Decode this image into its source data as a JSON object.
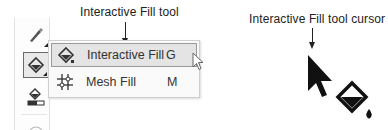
{
  "callouts": {
    "tool_label": "Interactive Fill tool",
    "cursor_label": "Interactive Fill tool cursor"
  },
  "toolbox": {
    "tools": [
      {
        "name": "pen-tool",
        "icon": "pen-icon",
        "active": false
      },
      {
        "name": "interactive-fill-tool",
        "icon": "fill-bucket-icon",
        "active": true
      },
      {
        "name": "smart-fill-tool",
        "icon": "smart-fill-icon",
        "active": false
      },
      {
        "name": "partially-visible-tool",
        "icon": "tool-icon",
        "active": false
      }
    ]
  },
  "flyout": {
    "items": [
      {
        "label": "Interactive Fill",
        "shortcut": "G",
        "icon": "fill-bucket-icon",
        "hovered": true
      },
      {
        "label": "Mesh Fill",
        "shortcut": "M",
        "icon": "mesh-fill-icon",
        "hovered": false
      }
    ]
  },
  "colors": {
    "text": "#2a2a2a",
    "hover_bg": "#e4e4e4",
    "menu_bg": "#fafafa",
    "border": "#cfcfcf"
  }
}
